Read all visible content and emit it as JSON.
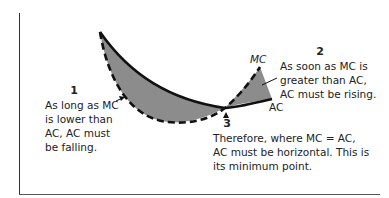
{
  "diagram": {
    "curves": {
      "mc_label": "MC",
      "ac_label": "AC",
      "fill_color": "#8c8c8c",
      "line_color": "#111111"
    },
    "notes": [
      {
        "number": "1",
        "lines": [
          "As long as MC",
          "is lower than",
          "AC, AC must",
          "be falling."
        ]
      },
      {
        "number": "2",
        "lines": [
          "As soon as MC is",
          "greater than AC,",
          "AC must be rising."
        ]
      },
      {
        "number": "3",
        "lines": [
          "Therefore, where MC = AC,",
          "AC must be horizontal. This is",
          "its minimum point."
        ]
      }
    ]
  }
}
